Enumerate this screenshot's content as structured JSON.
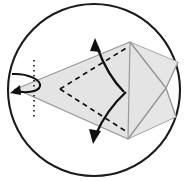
{
  "figure": {
    "canvas": {
      "width": 192,
      "height": 181,
      "background": "#ffffff"
    },
    "colors": {
      "circle_stroke": "#1a1a1a",
      "shade_fill": "#e2e2e2",
      "shade_fill_light": "#ededed",
      "panel_stroke": "#9a9a9a",
      "spine_stroke": "#8c8c8c",
      "fold_dashed": "#111111",
      "axis_dotted": "#2b2b2b",
      "arrow_fill": "#111111"
    },
    "circle": {
      "name": "bounding-circle",
      "cx": 94,
      "cy": 90,
      "r": 86,
      "stroke_width": 2.1
    },
    "axis": {
      "name": "vertical-dotted-axis",
      "x": 34,
      "y_top": 60,
      "y_bottom": 120,
      "dash": "1.6 3.4",
      "stroke_width": 1.7
    },
    "spine": {
      "name": "horizontal-center-spine",
      "x_start": 16,
      "x_end": 180,
      "y": 89,
      "stroke_width": 3.2
    },
    "kite": {
      "name": "kite-outline",
      "apex_left": [
        16,
        89
      ],
      "vertex_top": [
        130,
        42
      ],
      "vertex_right": [
        166,
        88
      ],
      "vertex_bottom": [
        128,
        139
      ],
      "points": "16,89 130,42 166,88 128,139"
    },
    "upper_wing": {
      "name": "upper-shaded-wing",
      "points": "130,42 178,62 166,88"
    },
    "lower_wing": {
      "name": "lower-shaded-wing",
      "points": "128,139 176,117 166,88"
    },
    "internal_lines": [
      {
        "name": "crease-top-to-right",
        "x1": 130,
        "y1": 42,
        "x2": 166,
        "y2": 88
      },
      {
        "name": "crease-bottom-to-right",
        "x1": 128,
        "y1": 139,
        "x2": 166,
        "y2": 88
      },
      {
        "name": "crease-vertical-right",
        "x1": 130,
        "y1": 42,
        "x2": 128,
        "y2": 139
      },
      {
        "name": "crease-top-outer",
        "x1": 130,
        "y1": 42,
        "x2": 178,
        "y2": 62
      },
      {
        "name": "crease-bottom-outer",
        "x1": 128,
        "y1": 139,
        "x2": 176,
        "y2": 117
      },
      {
        "name": "crease-right-outer-top",
        "x1": 166,
        "y1": 88,
        "x2": 178,
        "y2": 62
      },
      {
        "name": "crease-right-outer-bottom",
        "x1": 166,
        "y1": 88,
        "x2": 176,
        "y2": 117
      }
    ],
    "fold_lines_dashed": [
      {
        "name": "fold-upper-diagonal",
        "x1": 60,
        "y1": 89,
        "x2": 128,
        "y2": 47
      },
      {
        "name": "fold-lower-diagonal",
        "x1": 60,
        "y1": 89,
        "x2": 127,
        "y2": 132
      }
    ],
    "fold_arrows": [
      {
        "name": "fold-arrow-up",
        "path": "M 124,92 C 112,80 104,66 97,47",
        "head": "95,38 101,52 90,51",
        "direction": "up"
      },
      {
        "name": "fold-arrow-down",
        "path": "M 126,92 C 114,103 104,116 96,134",
        "head": "93,144 89,129 101,131",
        "direction": "down"
      }
    ],
    "rotation_arrow": {
      "name": "rotation-arrow-left-apex",
      "path": "M 12,74 C 28,73 41,80 40,86 C 39,92 24,94 14,90",
      "head": "10,93 20,85 21,95",
      "note": "small curved turn-over arrow at left apex"
    },
    "labels": []
  }
}
